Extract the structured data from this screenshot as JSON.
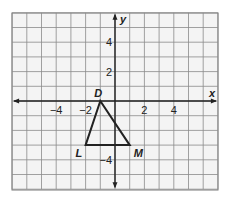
{
  "grid": {
    "x_min": -7,
    "x_max": 7,
    "y_min": -6,
    "y_max": 6,
    "origin_px": [
      115,
      101
    ],
    "cell_px": 14.7,
    "grid_color": "#7a7a7a",
    "axis_color": "#222222",
    "background": "#f4f4f4"
  },
  "axes": {
    "x_label": "x",
    "y_label": "y",
    "x_ticks": [
      {
        "value": -4,
        "label": "−4"
      },
      {
        "value": -2,
        "label": "−2"
      },
      {
        "value": 2,
        "label": "2"
      },
      {
        "value": 4,
        "label": "4"
      }
    ],
    "y_ticks": [
      {
        "value": 4,
        "label": "4"
      },
      {
        "value": 2,
        "label": "2"
      },
      {
        "value": -4,
        "label": "−4"
      }
    ]
  },
  "triangle": {
    "vertices": [
      {
        "name": "D",
        "x": -1,
        "y": 0
      },
      {
        "name": "L",
        "x": -2,
        "y": -3
      },
      {
        "name": "M",
        "x": 1,
        "y": -3
      }
    ],
    "stroke": "#222222"
  }
}
